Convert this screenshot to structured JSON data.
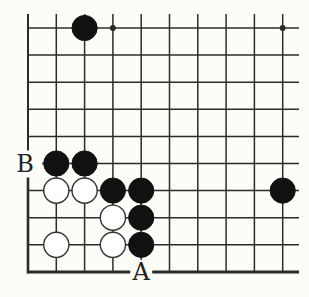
{
  "diagram": {
    "type": "go-board-fragment",
    "columns": 10,
    "rows": 10,
    "edges": [
      "bottom",
      "left"
    ],
    "colors": {
      "background": "#fdfdf8",
      "line": "#2b2b2b",
      "black": "#111111",
      "white": "#ffffff"
    },
    "star_points": [
      {
        "col": 3,
        "row": 0
      },
      {
        "col": 9,
        "row": 0
      }
    ],
    "stones": [
      {
        "color": "black",
        "col": 2,
        "row": 0
      },
      {
        "color": "black",
        "col": 1,
        "row": 5
      },
      {
        "color": "black",
        "col": 2,
        "row": 5
      },
      {
        "color": "white",
        "col": 1,
        "row": 6
      },
      {
        "color": "white",
        "col": 2,
        "row": 6
      },
      {
        "color": "black",
        "col": 3,
        "row": 6
      },
      {
        "color": "black",
        "col": 4,
        "row": 6
      },
      {
        "color": "black",
        "col": 9,
        "row": 6
      },
      {
        "color": "white",
        "col": 3,
        "row": 7
      },
      {
        "color": "black",
        "col": 4,
        "row": 7
      },
      {
        "color": "white",
        "col": 1,
        "row": 8
      },
      {
        "color": "white",
        "col": 3,
        "row": 8
      },
      {
        "color": "black",
        "col": 4,
        "row": 8
      }
    ],
    "labels": [
      {
        "text": "B",
        "col": 0,
        "row": 5
      },
      {
        "text": "A",
        "col": 4,
        "row": 9
      }
    ]
  }
}
